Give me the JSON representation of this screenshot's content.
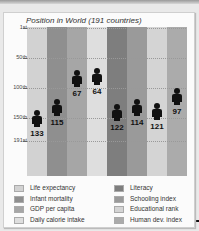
{
  "chart_data": {
    "type": "bar",
    "title": "Position in World (191 countries)",
    "xlabel": "",
    "ylabel": "",
    "y_axis": {
      "ticks": [
        "1st",
        "50th",
        "100th",
        "150th",
        "191st"
      ],
      "tick_values": [
        1,
        50,
        100,
        150,
        191
      ],
      "inverted": true,
      "ylim": [
        1,
        191
      ]
    },
    "grid": true,
    "legend_position": "bottom",
    "categories": [
      "Life expectancy",
      "Infant mortality",
      "GDP per capita",
      "Daily calorie intake",
      "Literacy",
      "Schooling index",
      "Educational rank",
      "Human dev. index"
    ],
    "values": [
      133,
      115,
      67,
      64,
      122,
      114,
      121,
      97
    ],
    "colors": [
      "#cfcfcf",
      "#8e8e8e",
      "#a3a3a3",
      "#dcdcdc",
      "#7d7d7d",
      "#989898",
      "#d0d0d0",
      "#a9a9a9"
    ],
    "marker": "person-icon"
  },
  "title": "Position in World (191 countries)",
  "ticks": [
    {
      "label": "1st",
      "y": 1
    },
    {
      "label": "50th",
      "y": 31
    },
    {
      "label": "100th",
      "y": 61
    },
    {
      "label": "150th",
      "y": 91
    },
    {
      "label": "191st",
      "y": 114
    }
  ],
  "columns": [
    {
      "label": "Life expectancy",
      "value": "133",
      "color": "#d2d2d2",
      "left": 0,
      "fig_top": 83
    },
    {
      "label": "Infant mortality",
      "value": "115",
      "color": "#8f8f8f",
      "left": 20,
      "fig_top": 72
    },
    {
      "label": "GDP per capita",
      "value": "67",
      "color": "#a6a6a6",
      "left": 40,
      "fig_top": 43
    },
    {
      "label": "Daily calorie intake",
      "value": "64",
      "color": "#dedede",
      "left": 60,
      "fig_top": 41
    },
    {
      "label": "Literacy",
      "value": "122",
      "color": "#7e7e7e",
      "left": 80,
      "fig_top": 77
    },
    {
      "label": "Schooling index",
      "value": "114",
      "color": "#9a9a9a",
      "left": 100,
      "fig_top": 72
    },
    {
      "label": "Educational rank",
      "value": "121",
      "color": "#d4d4d4",
      "left": 120,
      "fig_top": 76
    },
    {
      "label": "Human dev. index",
      "value": "97",
      "color": "#ababab",
      "left": 140,
      "fig_top": 61
    }
  ],
  "legend": {
    "left": [
      {
        "label": "Life expectancy",
        "color": "#d2d2d2"
      },
      {
        "label": "Infant mortality",
        "color": "#8f8f8f"
      },
      {
        "label": "GDP per capita",
        "color": "#a6a6a6"
      },
      {
        "label": "Daily calorie intake",
        "color": "#dedede"
      }
    ],
    "right": [
      {
        "label": "Literacy",
        "color": "#7e7e7e"
      },
      {
        "label": "Schooling index",
        "color": "#9a9a9a"
      },
      {
        "label": "Educational rank",
        "color": "#d4d4d4"
      },
      {
        "label": "Human dev. index",
        "color": "#ababab"
      }
    ]
  }
}
